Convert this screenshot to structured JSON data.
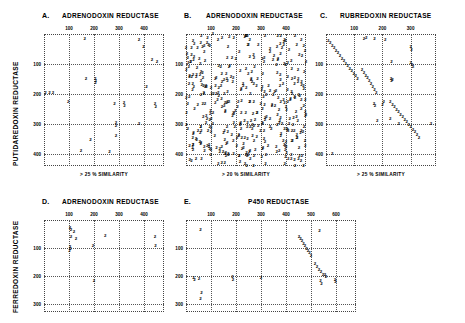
{
  "figure": {
    "kind": "dot-plot-matrix-figure",
    "row1_ylabel": "PUTIDAREDOXIN REDUCTASE",
    "row2_ylabel": "FERREDOXIN REDUCTASE"
  },
  "panels": [
    {
      "letter": "A.",
      "title": "ADRENODOXIN REDUCTASE",
      "caption": "> 25 % SIMILARITY",
      "xlabel": "ADRENODOXIN REDUCTASE",
      "ylabel": "PUTIDAREDOXIN REDUCTASE",
      "xticks": [
        100,
        200,
        300,
        400
      ],
      "yticks": [
        100,
        200,
        300,
        400
      ],
      "xlim": [
        0,
        480
      ],
      "ylim": [
        0,
        440
      ]
    },
    {
      "letter": "B.",
      "title": "ADRENODOXIN REDUCTASE",
      "caption": "> 20 % SIMILARITY",
      "xlabel": "ADRENODOXIN REDUCTASE",
      "ylabel": "PUTIDAREDOXIN REDUCTASE",
      "xticks": [
        100,
        200,
        300,
        400
      ],
      "yticks": [
        100,
        200,
        300,
        400
      ],
      "xlim": [
        0,
        480
      ],
      "ylim": [
        0,
        440
      ]
    },
    {
      "letter": "C.",
      "title": "RUBREDOXIN REDUCTASE",
      "caption": "> 25 % SIMILARITY",
      "xlabel": "RUBREDOXIN REDUCTASE",
      "ylabel": "PUTIDAREDOXIN REDUCTASE",
      "xticks": [
        100,
        200,
        300
      ],
      "yticks": [
        100,
        200,
        300,
        400
      ],
      "xlim": [
        0,
        390
      ],
      "ylim": [
        0,
        440
      ]
    },
    {
      "letter": "D.",
      "title": "ADRENODOXIN REDUCTASE",
      "caption": "",
      "xlabel": "ADRENODOXIN REDUCTASE",
      "ylabel": "FERREDOXIN REDUCTASE",
      "xticks": [
        100,
        200,
        300,
        400
      ],
      "yticks": [
        100,
        200,
        300
      ],
      "xlim": [
        0,
        480
      ],
      "ylim": [
        0,
        330
      ]
    },
    {
      "letter": "E.",
      "title": "P450 REDUCTASE",
      "caption": "",
      "xlabel": "P450 REDUCTASE",
      "ylabel": "FERREDOXIN REDUCTASE",
      "xticks": [
        100,
        200,
        300,
        400,
        500,
        600
      ],
      "yticks": [
        100,
        200,
        300
      ],
      "xlim": [
        0,
        680
      ],
      "ylim": [
        0,
        330
      ]
    }
  ],
  "chart_data": [
    {
      "type": "scatter",
      "panel": "A",
      "title": "ADRENODOXIN REDUCTASE",
      "xlabel": "ADRENODOXIN REDUCTASE",
      "ylabel": "PUTIDAREDOXIN REDUCTASE",
      "annotation": "> 25 % SIMILARITY",
      "marker_label": "2",
      "xlim": [
        0,
        480
      ],
      "ylim": [
        0,
        440
      ],
      "grid": true,
      "points": [
        [
          163,
          18
        ],
        [
          380,
          20
        ],
        [
          398,
          43
        ],
        [
          432,
          88
        ],
        [
          452,
          92
        ],
        [
          6,
          196
        ],
        [
          22,
          197
        ],
        [
          36,
          197
        ],
        [
          168,
          150
        ],
        [
          205,
          150
        ],
        [
          207,
          157
        ],
        [
          206,
          162
        ],
        [
          97,
          228
        ],
        [
          410,
          178
        ],
        [
          282,
          232
        ],
        [
          320,
          230
        ],
        [
          322,
          240
        ],
        [
          444,
          232
        ],
        [
          447,
          242
        ],
        [
          288,
          296
        ],
        [
          288,
          305
        ],
        [
          380,
          300
        ],
        [
          186,
          352
        ],
        [
          288,
          340
        ],
        [
          148,
          390
        ],
        [
          262,
          392
        ]
      ]
    },
    {
      "type": "scatter",
      "panel": "B",
      "title": "ADRENODOXIN REDUCTASE",
      "xlabel": "ADRENODOXIN REDUCTASE",
      "ylabel": "PUTIDAREDOXIN REDUCTASE",
      "annotation": "> 20 % SIMILARITY",
      "marker_label": "2",
      "xlim": [
        0,
        480
      ],
      "ylim": [
        0,
        440
      ],
      "grid": true,
      "density": "very-high",
      "note": "dense uniform noise field filling the whole matrix",
      "n_points": 430
    },
    {
      "type": "scatter",
      "panel": "C",
      "title": "RUBREDOXIN REDUCTASE",
      "xlabel": "RUBREDOXIN REDUCTASE",
      "ylabel": "PUTIDAREDOXIN REDUCTASE",
      "annotation": "> 25 % SIMILARITY",
      "marker_label": "2",
      "xlim": [
        0,
        390
      ],
      "ylim": [
        0,
        440
      ],
      "grid": true,
      "note": "two strong diagonal alignment tracks plus scattered noise",
      "diagonals": [
        {
          "from": [
            8,
            22
          ],
          "to": [
            112,
            150
          ],
          "n": 16
        },
        {
          "from": [
            128,
            120
          ],
          "to": [
            178,
            195
          ],
          "n": 9
        },
        {
          "from": [
            228,
            228
          ],
          "to": [
            330,
            345
          ],
          "n": 15
        }
      ],
      "points": [
        [
          135,
          18
        ],
        [
          143,
          12
        ],
        [
          172,
          18
        ],
        [
          210,
          20
        ],
        [
          300,
          42
        ],
        [
          303,
          52
        ],
        [
          300,
          96
        ],
        [
          305,
          102
        ],
        [
          308,
          110
        ],
        [
          232,
          92
        ],
        [
          230,
          150
        ],
        [
          232,
          158
        ],
        [
          236,
          152
        ],
        [
          170,
          232
        ],
        [
          174,
          240
        ],
        [
          205,
          228
        ],
        [
          200,
          238
        ],
        [
          182,
          290
        ],
        [
          228,
          282
        ],
        [
          258,
          300
        ],
        [
          372,
          300
        ],
        [
          22,
          400
        ]
      ]
    },
    {
      "type": "scatter",
      "panel": "D",
      "title": "ADRENODOXIN REDUCTASE",
      "xlabel": "ADRENODOXIN REDUCTASE",
      "ylabel": "FERREDOXIN REDUCTASE",
      "marker_label": "2",
      "xlim": [
        0,
        480
      ],
      "ylim": [
        0,
        330
      ],
      "grid": true,
      "points": [
        [
          104,
          30
        ],
        [
          108,
          36
        ],
        [
          120,
          42
        ],
        [
          108,
          60
        ],
        [
          128,
          68
        ],
        [
          245,
          58
        ],
        [
          104,
          98
        ],
        [
          106,
          104
        ],
        [
          102,
          110
        ],
        [
          196,
          94
        ],
        [
          444,
          60
        ],
        [
          446,
          92
        ],
        [
          200,
          218
        ]
      ]
    },
    {
      "type": "scatter",
      "panel": "E",
      "title": "P450 REDUCTASE",
      "xlabel": "P450 REDUCTASE",
      "ylabel": "FERREDOXIN REDUCTASE",
      "marker_label": "2",
      "xlim": [
        0,
        680
      ],
      "ylim": [
        0,
        330
      ],
      "grid": true,
      "note": "diagonal alignment track in the right half plus scattered noise",
      "diagonals": [
        {
          "from": [
            452,
            60
          ],
          "to": [
            500,
            128
          ],
          "n": 9
        },
        {
          "from": [
            516,
            158
          ],
          "to": [
            548,
            198
          ],
          "n": 5
        }
      ],
      "points": [
        [
          58,
          36
        ],
        [
          534,
          40
        ],
        [
          30,
          208
        ],
        [
          34,
          214
        ],
        [
          52,
          210
        ],
        [
          186,
          204
        ],
        [
          188,
          214
        ],
        [
          300,
          208
        ],
        [
          556,
          198
        ],
        [
          560,
          206
        ],
        [
          538,
          220
        ],
        [
          542,
          228
        ],
        [
          596,
          214
        ],
        [
          598,
          224
        ],
        [
          62,
          262
        ],
        [
          58,
          284
        ]
      ]
    }
  ]
}
